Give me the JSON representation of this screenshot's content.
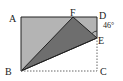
{
  "diagram": {
    "type": "geometry-folded-rectangle",
    "points": {
      "A": {
        "label": "A",
        "x": 21,
        "y": 17
      },
      "D": {
        "label": "D",
        "x": 97,
        "y": 17
      },
      "F": {
        "label": "F",
        "x": 73,
        "y": 17
      },
      "E": {
        "label": "E",
        "x": 97,
        "y": 38
      },
      "B": {
        "label": "B",
        "x": 21,
        "y": 71
      },
      "C": {
        "label": "C",
        "x": 97,
        "y": 71
      }
    },
    "angle_label": "46°",
    "colors": {
      "light_fill": "#b4b4b4",
      "dark_fill": "#6e6e6e",
      "stroke": "#222222",
      "dashed": "#666666"
    }
  }
}
